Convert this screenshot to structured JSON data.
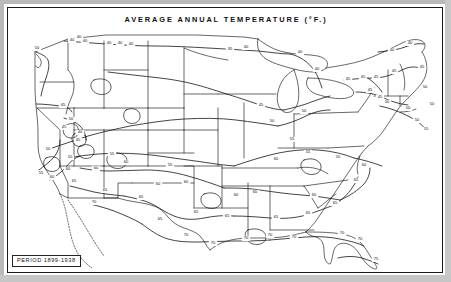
{
  "figure": {
    "title": "AVERAGE  ANNUAL  TEMPERATURE (°F.)",
    "caption": "PERIOD 1899-1938",
    "frame_color": "#1a1a1a",
    "background_color": "#ffffff",
    "ink_color": "#111111"
  },
  "chart_data": {
    "type": "map",
    "title": "AVERAGE  ANNUAL  TEMPERATURE (°F.)",
    "subtitle": "PERIOD 1899-1938",
    "region": "Contiguous United States",
    "quantity": "Average annual temperature",
    "units": "degrees Fahrenheit",
    "map_projection": "conic",
    "grid": false,
    "legend": "none",
    "contour_interval": 5,
    "contour_levels": [
      40,
      45,
      50,
      55,
      60,
      65,
      70,
      75
    ],
    "value_range": [
      40,
      75
    ],
    "isotherm_labels": [
      {
        "value": "50",
        "x": 29,
        "y": 41
      },
      {
        "value": "40",
        "x": 64,
        "y": 33
      },
      {
        "value": "40",
        "x": 71,
        "y": 30
      },
      {
        "value": "40",
        "x": 77,
        "y": 34
      },
      {
        "value": "40",
        "x": 101,
        "y": 36
      },
      {
        "value": "40",
        "x": 112,
        "y": 36
      },
      {
        "value": "40",
        "x": 123,
        "y": 37
      },
      {
        "value": "35",
        "x": 222,
        "y": 42
      },
      {
        "value": "40",
        "x": 238,
        "y": 40
      },
      {
        "value": "40",
        "x": 292,
        "y": 45
      },
      {
        "value": "40",
        "x": 309,
        "y": 62
      },
      {
        "value": "40",
        "x": 384,
        "y": 43
      },
      {
        "value": "40",
        "x": 402,
        "y": 36
      },
      {
        "value": "45",
        "x": 340,
        "y": 72
      },
      {
        "value": "45",
        "x": 355,
        "y": 70
      },
      {
        "value": "45",
        "x": 368,
        "y": 70
      },
      {
        "value": "45",
        "x": 386,
        "y": 64
      },
      {
        "value": "45",
        "x": 414,
        "y": 60
      },
      {
        "value": "50",
        "x": 417,
        "y": 80
      },
      {
        "value": "50",
        "x": 424,
        "y": 97
      },
      {
        "value": "45",
        "x": 362,
        "y": 83
      },
      {
        "value": "45",
        "x": 372,
        "y": 90
      },
      {
        "value": "50",
        "x": 379,
        "y": 95
      },
      {
        "value": "50",
        "x": 400,
        "y": 101
      },
      {
        "value": "50",
        "x": 409,
        "y": 113
      },
      {
        "value": "55",
        "x": 418,
        "y": 122
      },
      {
        "value": "50",
        "x": 296,
        "y": 104
      },
      {
        "value": "45",
        "x": 253,
        "y": 98
      },
      {
        "value": "50",
        "x": 264,
        "y": 114
      },
      {
        "value": "55",
        "x": 284,
        "y": 132
      },
      {
        "value": "45",
        "x": 55,
        "y": 98
      },
      {
        "value": "50",
        "x": 63,
        "y": 112
      },
      {
        "value": "45",
        "x": 56,
        "y": 120
      },
      {
        "value": "40",
        "x": 72,
        "y": 125
      },
      {
        "value": "45",
        "x": 70,
        "y": 133
      },
      {
        "value": "50",
        "x": 40,
        "y": 142
      },
      {
        "value": "55",
        "x": 33,
        "y": 166
      },
      {
        "value": "60",
        "x": 44,
        "y": 170
      },
      {
        "value": "55",
        "x": 62,
        "y": 150
      },
      {
        "value": "60",
        "x": 60,
        "y": 162
      },
      {
        "value": "65",
        "x": 66,
        "y": 174
      },
      {
        "value": "60",
        "x": 88,
        "y": 161
      },
      {
        "value": "55",
        "x": 104,
        "y": 147
      },
      {
        "value": "60",
        "x": 118,
        "y": 155
      },
      {
        "value": "65",
        "x": 97,
        "y": 183
      },
      {
        "value": "70",
        "x": 86,
        "y": 195
      },
      {
        "value": "65",
        "x": 133,
        "y": 190
      },
      {
        "value": "60",
        "x": 150,
        "y": 177
      },
      {
        "value": "55",
        "x": 162,
        "y": 158
      },
      {
        "value": "60",
        "x": 178,
        "y": 175
      },
      {
        "value": "65",
        "x": 188,
        "y": 205
      },
      {
        "value": "65",
        "x": 152,
        "y": 212
      },
      {
        "value": "70",
        "x": 178,
        "y": 228
      },
      {
        "value": "70",
        "x": 205,
        "y": 236
      },
      {
        "value": "65",
        "x": 219,
        "y": 209
      },
      {
        "value": "60",
        "x": 228,
        "y": 188
      },
      {
        "value": "60",
        "x": 247,
        "y": 185
      },
      {
        "value": "70",
        "x": 238,
        "y": 231
      },
      {
        "value": "65",
        "x": 268,
        "y": 210
      },
      {
        "value": "70",
        "x": 262,
        "y": 228
      },
      {
        "value": "70",
        "x": 286,
        "y": 230
      },
      {
        "value": "65",
        "x": 300,
        "y": 206
      },
      {
        "value": "60",
        "x": 306,
        "y": 188
      },
      {
        "value": "65",
        "x": 327,
        "y": 196
      },
      {
        "value": "65",
        "x": 348,
        "y": 173
      },
      {
        "value": "70",
        "x": 334,
        "y": 226
      },
      {
        "value": "70",
        "x": 352,
        "y": 232
      },
      {
        "value": "75",
        "x": 368,
        "y": 252
      },
      {
        "value": "60",
        "x": 268,
        "y": 152
      },
      {
        "value": "55",
        "x": 300,
        "y": 145
      },
      {
        "value": "55",
        "x": 330,
        "y": 150
      },
      {
        "value": "60",
        "x": 356,
        "y": 158
      }
    ]
  }
}
